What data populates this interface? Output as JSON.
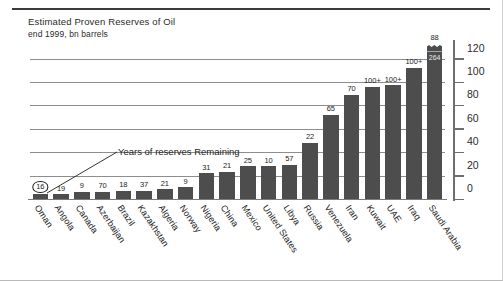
{
  "chart_data": {
    "type": "bar",
    "title": "Estimated Proven Reserves of Oil",
    "subtitle": "end 1999, bn barrels",
    "xlabel": "",
    "ylabel": "",
    "ylim": [
      0,
      130
    ],
    "yticks": [
      0,
      20,
      40,
      60,
      80,
      100,
      120
    ],
    "ytick_labels": [
      "0",
      "20",
      "40",
      "60",
      "80",
      "100",
      "120"
    ],
    "grid": true,
    "legend": "none",
    "bar_color": "#4d4d4d",
    "axis_note": "Top bar is broken; Saudi Arabia value 264 printed inside the break cap.",
    "annotation": {
      "text": "Years of reserves Remaining",
      "points_to": "Oman",
      "description": "Leader line from label down-left to the circled 16 above the Oman bar"
    },
    "categories": [
      "Oman",
      "Angola",
      "Canada",
      "Azerbaijan",
      "Brazil",
      "Kazakhstan",
      "Algeria",
      "Norway",
      "Nigeria",
      "China",
      "Mexico",
      "United States",
      "Libya",
      "Russia",
      "Venezuela",
      "Iran",
      "Kuwait",
      "UAE",
      "Iraq",
      "Saudi Arabia"
    ],
    "series": [
      {
        "name": "Proven reserves (bn barrels)",
        "values": [
          5,
          5,
          7,
          7,
          8,
          8,
          9,
          11,
          23,
          24,
          29,
          29,
          30,
          49,
          73,
          90,
          97,
          98,
          113,
          264
        ]
      },
      {
        "name": "Years of reserves remaining",
        "values": [
          16,
          19,
          9,
          70,
          18,
          37,
          21,
          9,
          31,
          21,
          25,
          10,
          57,
          22,
          65,
          70,
          "100+",
          "100+",
          "100+",
          88
        ]
      }
    ],
    "bars": [
      {
        "label": "Oman",
        "value": 5,
        "years": "16",
        "years_circled": true
      },
      {
        "label": "Angola",
        "value": 5,
        "years": "19",
        "years_circled": false
      },
      {
        "label": "Canada",
        "value": 7,
        "years": "9",
        "years_circled": false
      },
      {
        "label": "Azerbaijan",
        "value": 7,
        "years": "70",
        "years_circled": false
      },
      {
        "label": "Brazil",
        "value": 8,
        "years": "18",
        "years_circled": false
      },
      {
        "label": "Kazakhstan",
        "value": 8,
        "years": "37",
        "years_circled": false
      },
      {
        "label": "Algeria",
        "value": 9,
        "years": "21",
        "years_circled": false
      },
      {
        "label": "Norway",
        "value": 11,
        "years": "9",
        "years_circled": false
      },
      {
        "label": "Nigeria",
        "value": 23,
        "years": "31",
        "years_circled": false
      },
      {
        "label": "China",
        "value": 24,
        "years": "21",
        "years_circled": false
      },
      {
        "label": "Mexico",
        "value": 29,
        "years": "25",
        "years_circled": false
      },
      {
        "label": "United States",
        "value": 29,
        "years": "10",
        "years_circled": false
      },
      {
        "label": "Libya",
        "value": 30,
        "years": "57",
        "years_circled": false
      },
      {
        "label": "Russia",
        "value": 49,
        "years": "22",
        "years_circled": false
      },
      {
        "label": "Venezuela",
        "value": 73,
        "years": "65",
        "years_circled": false
      },
      {
        "label": "Iran",
        "value": 90,
        "years": "70",
        "years_circled": false
      },
      {
        "label": "Kuwait",
        "value": 97,
        "years": "100+",
        "years_circled": false
      },
      {
        "label": "UAE",
        "value": 98,
        "years": "100+",
        "years_circled": false
      },
      {
        "label": "Iraq",
        "value": 113,
        "years": "100+",
        "years_circled": false
      },
      {
        "label": "Saudi Arabia",
        "value": 264,
        "years": "88",
        "years_circled": false,
        "broken": true,
        "cap_value": "264",
        "top_value": "88",
        "drawn_to": 127
      }
    ]
  }
}
